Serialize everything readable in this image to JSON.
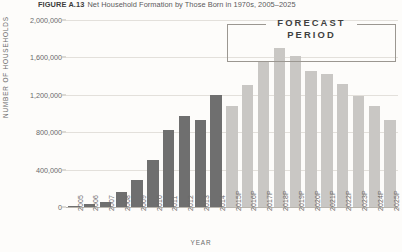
{
  "figure": {
    "tag": "FIGURE A.13",
    "title": "Net Household Formation by Those Born in 1970s, 2005–2025"
  },
  "annotation": {
    "forecast_line1": "FORECAST",
    "forecast_line2": "PERIOD"
  },
  "chart_data": {
    "type": "bar",
    "title": "Net Household Formation by Those Born in 1970s, 2005–2025",
    "xlabel": "YEAR",
    "ylabel": "NUMBER OF HOUSEHOLDS",
    "ylim": [
      0,
      2000000
    ],
    "ytick_labels": [
      "0",
      "400,000",
      "800,000",
      "1,200,000",
      "1,600,000",
      "2,000,000"
    ],
    "ytick_values": [
      0,
      400000,
      800000,
      1200000,
      1600000,
      2000000
    ],
    "grid": true,
    "legend": "none",
    "categories": [
      "2005",
      "2006",
      "2007",
      "2008",
      "2009",
      "2010",
      "2011",
      "2012",
      "2013",
      "2014",
      "2015P",
      "2016P",
      "2017P",
      "2018P",
      "2019P",
      "2020P",
      "2021P",
      "2022P",
      "2023P",
      "2024P",
      "2025P"
    ],
    "series": [
      {
        "name": "Net household formation",
        "values": [
          15000,
          30000,
          55000,
          160000,
          290000,
          500000,
          820000,
          970000,
          930000,
          1200000,
          1080000,
          1300000,
          1560000,
          1700000,
          1620000,
          1460000,
          1420000,
          1320000,
          1190000,
          1080000,
          930000
        ]
      }
    ],
    "segments": [
      {
        "name": "historical",
        "categories": [
          "2005",
          "2006",
          "2007",
          "2008",
          "2009",
          "2010",
          "2011",
          "2012",
          "2013",
          "2014"
        ],
        "color": "#6f6f6f"
      },
      {
        "name": "forecast",
        "categories": [
          "2015P",
          "2016P",
          "2017P",
          "2018P",
          "2019P",
          "2020P",
          "2021P",
          "2022P",
          "2023P",
          "2024P",
          "2025P"
        ],
        "color": "#c9c7c4"
      }
    ],
    "annotations": [
      {
        "text": "FORECAST PERIOD",
        "spans": [
          "2015P",
          "2025P"
        ]
      }
    ]
  }
}
